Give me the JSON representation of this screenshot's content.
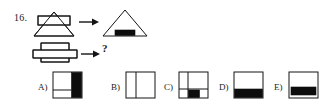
{
  "page": {
    "question_number": "16.",
    "unknown_marker": "?",
    "background_color": "#ffffff",
    "ink_color": "#141414",
    "fill_color": "#0d0d0d"
  },
  "prompt": {
    "row1": {
      "input_name": "triangle-with-overlapping-rectangle",
      "arrow": "right-arrow",
      "output_name": "triangle-with-black-rectangle-at-base"
    },
    "row2": {
      "input_name": "two-overlapping-rectangles",
      "arrow": "right-arrow",
      "output_name": "unknown-question-mark"
    }
  },
  "options": [
    {
      "key": "A",
      "label": "A)",
      "name": "option-a-square-black-right-band",
      "description": "Square with black vertical band on right side and horizontal divider on white left portion"
    },
    {
      "key": "B",
      "label": "B)",
      "name": "option-b-square-vertical-divider",
      "description": "Plain white square with a vertical dividing line near the left"
    },
    {
      "key": "C",
      "label": "C)",
      "name": "option-c-square-black-bottom-center-block",
      "description": "Square with cross dividers and a small black block in the lower middle cell"
    },
    {
      "key": "D",
      "label": "D)",
      "name": "option-d-square-black-bottom-band",
      "description": "Square with a black horizontal band across the bottom"
    },
    {
      "key": "E",
      "label": "E)",
      "name": "option-e-square-black-bottom-inset-band",
      "description": "Square with an inset black horizontal band near the bottom"
    }
  ]
}
